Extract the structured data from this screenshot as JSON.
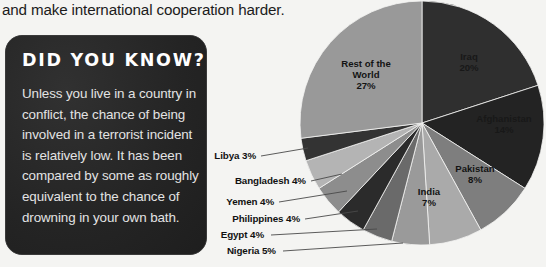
{
  "page": {
    "background_color": "#f4f4f2",
    "body_text": "and make international cooperation harder."
  },
  "did_you_know": {
    "title": "DID YOU KNOW?",
    "body": "Unless you live in a country in conflict, the chance of being involved in a terrorist incident is relatively low. It has been compared by some as roughly equivalent to the chance of drowning in your own bath.",
    "panel_color": "#262626",
    "title_color": "#ffffff",
    "body_color": "#e3e3e3"
  },
  "chart_data": {
    "type": "pie",
    "title": "",
    "start_angle_deg": 0,
    "direction": "clockwise",
    "units": "percent",
    "legend": "none (labels on slices and callouts)",
    "categories": [
      "Iraq",
      "Afghanistan",
      "Pakistan",
      "India",
      "Nigeria",
      "Egypt",
      "Philippines",
      "Yemen",
      "Bangladesh",
      "Libya",
      "Rest of the World"
    ],
    "values": [
      20,
      14,
      8,
      7,
      5,
      4,
      4,
      4,
      4,
      3,
      27
    ],
    "slices": [
      {
        "name": "Iraq",
        "value": 20,
        "label": "Iraq",
        "percent_text": "20%",
        "color": "#2f2f2f",
        "label_style": "inside"
      },
      {
        "name": "Afghanistan",
        "value": 14,
        "label": "Afghanistan",
        "percent_text": "14%",
        "color": "#232323",
        "label_style": "inside"
      },
      {
        "name": "Pakistan",
        "value": 8,
        "label": "Pakistan",
        "percent_text": "8%",
        "color": "#7e7e7e",
        "label_style": "inside"
      },
      {
        "name": "India",
        "value": 7,
        "label": "India",
        "percent_text": "7%",
        "color": "#aaaaaa",
        "label_style": "inside"
      },
      {
        "name": "Nigeria",
        "value": 5,
        "label": "Nigeria 5%",
        "percent_text": "5%",
        "color": "#9a9a9a",
        "label_style": "callout"
      },
      {
        "name": "Egypt",
        "value": 4,
        "label": "Egypt 4%",
        "percent_text": "4%",
        "color": "#6a6a6a",
        "label_style": "callout"
      },
      {
        "name": "Philippines",
        "value": 4,
        "label": "Philippines 4%",
        "percent_text": "4%",
        "color": "#2b2b2b",
        "label_style": "callout"
      },
      {
        "name": "Yemen",
        "value": 4,
        "label": "Yemen 4%",
        "percent_text": "4%",
        "color": "#8d8d8d",
        "label_style": "callout"
      },
      {
        "name": "Bangladesh",
        "value": 4,
        "label": "Bangladesh 4%",
        "percent_text": "4%",
        "color": "#b4b4b4",
        "label_style": "callout"
      },
      {
        "name": "Libya",
        "value": 3,
        "label": "Libya 3%",
        "percent_text": "3%",
        "color": "#333333",
        "label_style": "callout"
      },
      {
        "name": "Rest of the World",
        "value": 27,
        "label": "Rest of the World",
        "percent_text": "27%",
        "color": "#999999",
        "label_style": "inside"
      }
    ],
    "inside_labels": [
      {
        "key": "iraq",
        "line1": "Iraq",
        "line2": "",
        "line3": "20%"
      },
      {
        "key": "afghanistan",
        "line1": "Afghanistan",
        "line2": "",
        "line3": "14%"
      },
      {
        "key": "pakistan",
        "line1": "Pakistan",
        "line2": "",
        "line3": "8%"
      },
      {
        "key": "india",
        "line1": "India",
        "line2": "",
        "line3": "7%"
      },
      {
        "key": "rest",
        "line1": "Rest of the",
        "line2": "World",
        "line3": "27%"
      }
    ],
    "callout_labels": [
      {
        "key": "libya",
        "text": "Libya 3%"
      },
      {
        "key": "bangladesh",
        "text": "Bangladesh 4%"
      },
      {
        "key": "yemen",
        "text": "Yemen 4%"
      },
      {
        "key": "philippines",
        "text": "Philippines 4%"
      },
      {
        "key": "egypt",
        "text": "Egypt 4%"
      },
      {
        "key": "nigeria",
        "text": "Nigeria 5%"
      }
    ]
  }
}
